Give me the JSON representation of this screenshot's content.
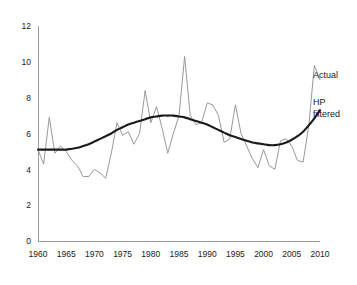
{
  "chart_data": {
    "type": "line",
    "title": "",
    "xlabel": "",
    "ylabel": "",
    "xlim": [
      1960,
      2010
    ],
    "ylim": [
      0,
      12
    ],
    "grid": false,
    "legend_position": "right",
    "xticks": [
      1960,
      1965,
      1970,
      1975,
      1980,
      1985,
      1990,
      1995,
      2000,
      2005,
      2010
    ],
    "xtick_labels": [
      "1960",
      "1965",
      "1970",
      "1975",
      "1980",
      "1985",
      "1990",
      "1995",
      "2000",
      "2005",
      "2010"
    ],
    "yticks": [
      0,
      2,
      4,
      6,
      8,
      10,
      12
    ],
    "ytick_labels": [
      "0",
      "2",
      "4",
      "6",
      "8",
      "10",
      "12"
    ],
    "x": [
      1960,
      1961,
      1962,
      1963,
      1964,
      1965,
      1966,
      1967,
      1968,
      1969,
      1970,
      1971,
      1972,
      1973,
      1974,
      1975,
      1976,
      1977,
      1978,
      1979,
      1980,
      1981,
      1982,
      1983,
      1984,
      1985,
      1986,
      1987,
      1988,
      1989,
      1990,
      1991,
      1992,
      1993,
      1994,
      1995,
      1996,
      1997,
      1998,
      1999,
      2000,
      2001,
      2002,
      2003,
      2004,
      2005,
      2006,
      2007,
      2008,
      2009,
      2010
    ],
    "series": [
      {
        "name": "Actual",
        "color": "#8d8d8d",
        "style": "thin",
        "values": [
          5.1,
          4.3,
          6.9,
          4.9,
          5.3,
          5.0,
          4.5,
          4.2,
          3.6,
          3.6,
          4.0,
          3.8,
          3.5,
          4.9,
          6.6,
          5.9,
          6.1,
          5.4,
          6.0,
          8.4,
          6.6,
          7.5,
          6.3,
          4.9,
          6.0,
          7.0,
          10.3,
          7.0,
          6.5,
          6.6,
          7.7,
          7.6,
          7.0,
          5.5,
          5.7,
          7.6,
          6.0,
          5.3,
          4.6,
          4.1,
          5.1,
          4.2,
          4.0,
          5.6,
          5.7,
          5.3,
          4.5,
          4.4,
          6.4,
          9.8,
          9.0
        ]
      },
      {
        "name": "HP filtered",
        "color": "#1a1a1a",
        "style": "thick",
        "values": [
          5.1,
          5.1,
          5.1,
          5.1,
          5.1,
          5.1,
          5.15,
          5.2,
          5.3,
          5.4,
          5.55,
          5.7,
          5.85,
          6.0,
          6.2,
          6.35,
          6.5,
          6.6,
          6.7,
          6.8,
          6.9,
          6.95,
          7.0,
          7.0,
          7.0,
          6.95,
          6.9,
          6.8,
          6.7,
          6.6,
          6.5,
          6.35,
          6.2,
          6.05,
          5.9,
          5.8,
          5.7,
          5.6,
          5.5,
          5.45,
          5.4,
          5.35,
          5.35,
          5.4,
          5.5,
          5.65,
          5.85,
          6.1,
          6.45,
          6.85,
          7.3
        ]
      }
    ],
    "legend": [
      {
        "label": "Actual",
        "series": "Actual"
      },
      {
        "label": "HP",
        "label2": "filtered",
        "series": "HP filtered"
      }
    ]
  },
  "legend_labels": {
    "actual": "Actual",
    "hp_line1": "HP",
    "hp_line2": "filtered"
  }
}
